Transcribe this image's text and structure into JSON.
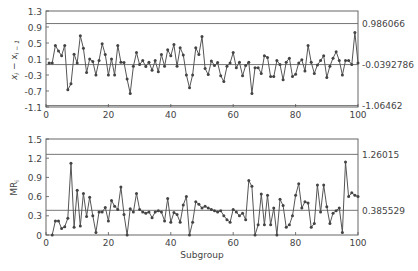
{
  "chart_data": [
    {
      "type": "line",
      "title": "",
      "xlabel": "",
      "ylabel": "x_i − x_{i−1}",
      "xlim": [
        0,
        100
      ],
      "ylim": [
        -1.1,
        1.3
      ],
      "xticks": [
        0,
        20,
        40,
        60,
        80,
        100
      ],
      "yticks": [
        -1.1,
        -0.7,
        -0.3,
        0.1,
        0.5,
        0.9,
        1.3
      ],
      "ytick_labels": [
        "-1.1",
        "-0.7",
        "-0.3",
        "0.1",
        "0.5",
        "0.9",
        "1.3"
      ],
      "grid": false,
      "control_limits": {
        "UCL": 0.986066,
        "CL": -0.0392786,
        "LCL": -1.06462
      },
      "control_limit_labels": [
        "0.986066",
        "-0.0392786",
        "-1.06462"
      ],
      "series": [
        {
          "name": "differences",
          "x": [
            1,
            2,
            3,
            4,
            5,
            6,
            7,
            8,
            9,
            10,
            11,
            12,
            13,
            14,
            15,
            16,
            17,
            18,
            19,
            20,
            21,
            22,
            23,
            24,
            25,
            26,
            27,
            28,
            29,
            30,
            31,
            32,
            33,
            34,
            35,
            36,
            37,
            38,
            39,
            40,
            41,
            42,
            43,
            44,
            45,
            46,
            47,
            48,
            49,
            50,
            51,
            52,
            53,
            54,
            55,
            56,
            57,
            58,
            59,
            60,
            61,
            62,
            63,
            64,
            65,
            66,
            67,
            68,
            69,
            70,
            71,
            72,
            73,
            74,
            75,
            76,
            77,
            78,
            79,
            80,
            81,
            82,
            83,
            84,
            85,
            86,
            87,
            88,
            89,
            90,
            91,
            92,
            93,
            94,
            95,
            96,
            97,
            98,
            99,
            100
          ],
          "values": [
            0.0,
            0.0,
            0.44,
            0.3,
            0.18,
            0.44,
            -0.67,
            -0.52,
            0.22,
            0.0,
            0.68,
            0.37,
            -0.24,
            0.1,
            0.04,
            -0.3,
            0.06,
            0.48,
            0.21,
            -0.3,
            0.1,
            -0.3,
            0.44,
            0.02,
            0.01,
            -0.4,
            -0.76,
            -0.08,
            0.26,
            -0.04,
            0.06,
            -0.09,
            0.02,
            -0.18,
            0.06,
            -0.22,
            0.21,
            -0.08,
            0.33,
            0.18,
            0.46,
            -0.08,
            0.38,
            0.2,
            -0.3,
            -0.62,
            -0.3,
            0.38,
            0.21,
            0.66,
            -0.14,
            -0.29,
            0.05,
            -0.06,
            0.01,
            -0.32,
            -0.46,
            -0.08,
            0.0,
            0.26,
            -0.12,
            0.02,
            -0.32,
            -0.06,
            0.02,
            -0.76,
            -0.12,
            -0.12,
            -0.26,
            0.18,
            0.14,
            -0.34,
            -0.34,
            0.06,
            -0.04,
            -0.42,
            0.02,
            0.12,
            -0.34,
            -0.28,
            0.0,
            0.08,
            -0.2,
            0.44,
            0.02,
            -0.26,
            -0.05,
            0.06,
            0.18,
            -0.36,
            -0.08,
            0.12,
            0.28,
            0.06,
            -0.3,
            0.06,
            0.06,
            -0.04,
            0.76,
            0.0
          ]
        }
      ]
    },
    {
      "type": "line",
      "title": "",
      "xlabel": "Subgroup",
      "ylabel": "MR_i",
      "xlim": [
        0,
        100
      ],
      "ylim": [
        0,
        1.5
      ],
      "xticks": [
        0,
        20,
        40,
        60,
        80,
        100
      ],
      "yticks": [
        0,
        0.3,
        0.6,
        0.9,
        1.2,
        1.5
      ],
      "ytick_labels": [
        "0",
        "0.3",
        "0.6",
        "0.9",
        "1.2",
        "1.5"
      ],
      "grid": false,
      "control_limits": {
        "UCL": 1.26015,
        "CL": 0.385529
      },
      "control_limit_labels": [
        "1.26015",
        "0.385529"
      ],
      "series": [
        {
          "name": "moving range",
          "x": [
            2,
            3,
            4,
            5,
            6,
            7,
            8,
            9,
            10,
            11,
            12,
            13,
            14,
            15,
            16,
            17,
            18,
            19,
            20,
            21,
            22,
            23,
            24,
            25,
            26,
            27,
            28,
            29,
            30,
            31,
            32,
            33,
            34,
            35,
            36,
            37,
            38,
            39,
            40,
            41,
            42,
            43,
            44,
            45,
            46,
            47,
            48,
            49,
            50,
            51,
            52,
            53,
            54,
            55,
            56,
            57,
            58,
            59,
            60,
            61,
            62,
            63,
            64,
            65,
            66,
            67,
            68,
            69,
            70,
            71,
            72,
            73,
            74,
            75,
            76,
            77,
            78,
            79,
            80,
            81,
            82,
            83,
            84,
            85,
            86,
            87,
            88,
            89,
            90,
            91,
            92,
            93,
            94,
            95,
            96,
            97,
            98,
            99,
            100
          ],
          "values": [
            0.0,
            0.22,
            0.22,
            0.1,
            0.13,
            0.26,
            1.12,
            0.12,
            0.7,
            0.14,
            0.65,
            0.29,
            0.59,
            0.3,
            0.04,
            0.36,
            0.36,
            0.43,
            0.22,
            0.54,
            0.45,
            0.4,
            0.75,
            0.32,
            0.0,
            0.41,
            0.36,
            0.65,
            0.4,
            0.36,
            0.34,
            0.36,
            0.27,
            0.36,
            0.38,
            0.36,
            0.22,
            0.57,
            0.2,
            0.35,
            0.32,
            0.2,
            0.47,
            0.6,
            0.0,
            0.2,
            0.52,
            0.48,
            0.42,
            0.45,
            0.42,
            0.4,
            0.38,
            0.36,
            0.38,
            0.3,
            0.24,
            0.2,
            0.4,
            0.36,
            0.3,
            0.34,
            0.24,
            0.85,
            0.76,
            0.0,
            0.16,
            0.64,
            0.16,
            0.62,
            0.16,
            0.42,
            0.0,
            0.56,
            0.46,
            0.12,
            0.16,
            0.3,
            0.62,
            0.8,
            0.42,
            0.52,
            0.5,
            0.12,
            0.18,
            0.78,
            0.36,
            0.78,
            0.44,
            0.18,
            0.34,
            0.38,
            0.42,
            0.04,
            1.14,
            0.6,
            0.66,
            0.62,
            0.6
          ]
        }
      ]
    }
  ],
  "top_chart": {
    "ylabel_main": "x",
    "ylabel_sub1": "i",
    "ylabel_mid": " − x",
    "ylabel_sub2": "i − 1",
    "ucl_label": "0.986066",
    "cl_label": "-0.0392786",
    "lcl_label": "-1.06462",
    "ytick_labels": [
      "1.3",
      "0.9",
      "0.5",
      "0.1",
      "-0.3",
      "-0.7",
      "-1.1"
    ],
    "xtick_labels": [
      "0",
      "20",
      "40",
      "60",
      "80",
      "100"
    ]
  },
  "bottom_chart": {
    "ylabel_main": "MR",
    "ylabel_sub": "i",
    "ucl_label": "1.26015",
    "cl_label": "0.385529",
    "ytick_labels": [
      "1.5",
      "1.2",
      "0.9",
      "0.6",
      "0.3",
      "0"
    ],
    "xtick_labels": [
      "0",
      "20",
      "40",
      "60",
      "80",
      "100"
    ],
    "xlabel": "Subgroup"
  },
  "colors": {
    "line": "#555555",
    "marker": "#444444",
    "limit_line": "#666666",
    "axis": "#555555",
    "text": "#444444"
  }
}
